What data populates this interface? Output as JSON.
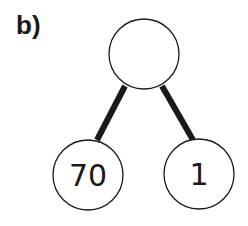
{
  "label": "b)",
  "tree": {
    "root": {
      "value": "",
      "cx": 144,
      "cy": 54,
      "r": 35
    },
    "children": [
      {
        "value": "70",
        "cx": 88,
        "cy": 175,
        "r": 35,
        "edge": [
          125,
          86,
          97,
          140
        ]
      },
      {
        "value": "1",
        "cx": 199,
        "cy": 174,
        "r": 35,
        "edge": [
          162,
          86,
          193,
          140
        ]
      }
    ]
  },
  "colors": {
    "stroke": "#1a1a1a",
    "fill": "#ffffff"
  }
}
